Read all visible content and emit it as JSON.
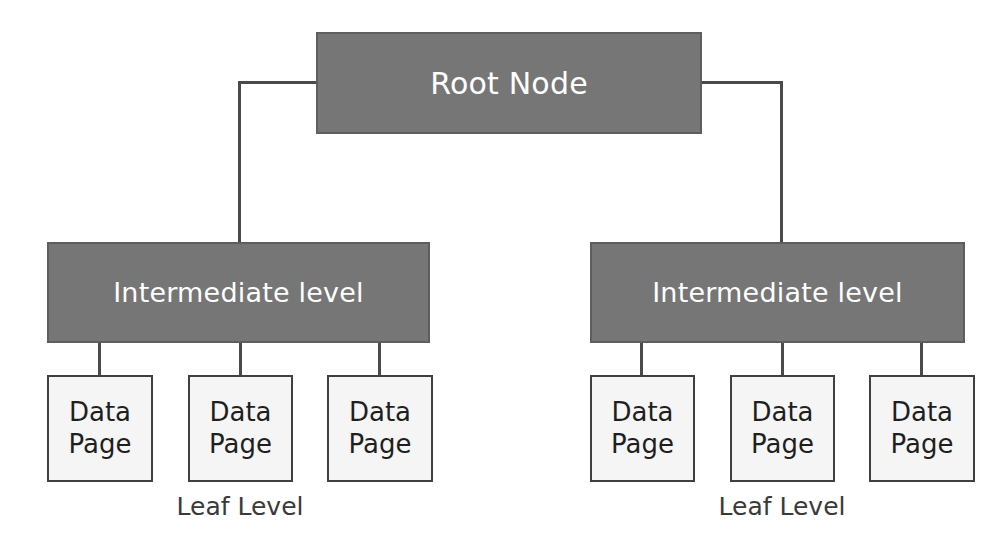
{
  "diagram": {
    "type": "tree",
    "colors": {
      "internal_node_fill": "#767676",
      "internal_node_border": "#5e5e5e",
      "internal_node_text": "#ffffff",
      "leaf_node_fill": "#f5f5f5",
      "leaf_node_border": "#404040",
      "leaf_node_text": "#1f1f1f",
      "connector": "#4a4a4a",
      "caption_text": "#3a3a3a",
      "background": "#ffffff"
    },
    "root": {
      "label": "Root Node"
    },
    "intermediate": [
      {
        "label": "Intermediate level"
      },
      {
        "label": "Intermediate level"
      }
    ],
    "leaves": [
      {
        "line1": "Data",
        "line2": "Page"
      },
      {
        "line1": "Data",
        "line2": "Page"
      },
      {
        "line1": "Data",
        "line2": "Page"
      },
      {
        "line1": "Data",
        "line2": "Page"
      },
      {
        "line1": "Data",
        "line2": "Page"
      },
      {
        "line1": "Data",
        "line2": "Page"
      }
    ],
    "captions": [
      {
        "label": "Leaf Level"
      },
      {
        "label": "Leaf Level"
      }
    ]
  }
}
